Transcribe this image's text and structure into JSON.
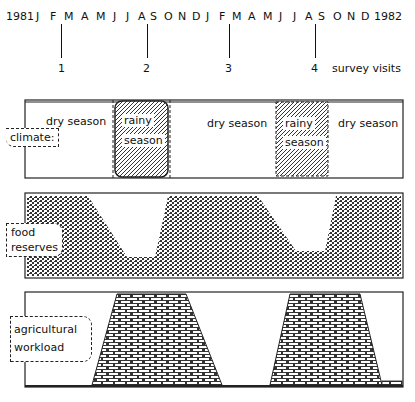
{
  "timeline": {
    "start_year": "1981",
    "end_year": "1982",
    "months": [
      "J",
      "F",
      "M",
      "A",
      "M",
      "J",
      "J",
      "A",
      "S",
      "O",
      "N",
      "D",
      "J",
      "F",
      "M",
      "A",
      "M",
      "J",
      "J",
      "A",
      "S",
      "O",
      "N",
      "D"
    ],
    "survey_visits": [
      "1",
      "2",
      "3",
      "4"
    ],
    "survey_label": "survey visits"
  },
  "panels": {
    "climate": {
      "label": "climate:",
      "segments": [
        "dry season",
        "rainy season",
        "dry season",
        "rainy season",
        "dry season"
      ],
      "dry_label": "dry season",
      "rainy_label_1": "rainy",
      "rainy_label_2": "season"
    },
    "food": {
      "label_1": "food",
      "label_2": "reserves"
    },
    "workload": {
      "label_1": "agricultural",
      "label_2": "workload"
    }
  }
}
